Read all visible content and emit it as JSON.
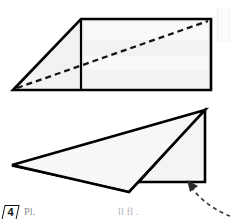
{
  "figure": {
    "step_number": "4",
    "caption_partial": "Pl.",
    "caption_partial_2": "ll  fl .",
    "background_color": "#ffffff",
    "paper_fill": "#f2f2f2",
    "paper_fill_light": "#fafafa",
    "outline_color": "#000000",
    "shadow_color": "#000000",
    "fold_line_color": "#1a1a1a",
    "arrow_color": "#3a3a3a"
  },
  "top_shape": {
    "name": "unfolded-trapezoid-with-diagonal-crease",
    "outline_points": "13,90 81,19 211,19 211,90",
    "fill": "#f2f2f2",
    "stroke_width": "2.6",
    "vertical_fold_line": {
      "x1": 81,
      "y1": 19,
      "x2": 81,
      "y2": 90
    },
    "diagonal_crease": {
      "x1": 17,
      "y1": 88,
      "x2": 208,
      "y2": 21,
      "style": "dashed"
    },
    "crease_dash_pattern": "6 4"
  },
  "bottom_shape": {
    "name": "folded-paper-with-black-wedge",
    "left_flap_points": "12,165 205,110 128,191",
    "right_panel_points": "205,110 205,182 125,182",
    "black_wedge_points": "205,110 122,182 138,182",
    "apex": {
      "x": 205,
      "y": 110
    },
    "left_tip": {
      "x": 12,
      "y": 165
    },
    "bottom_right": {
      "x": 205,
      "y": 182
    },
    "fill": "#f4f4f4",
    "stroke_width": "2.6"
  },
  "motion_arrow": {
    "name": "curved-fold-arrow",
    "path": "M 228,214 C 216,210 200,200 191,187",
    "style": "dashed",
    "dash_pattern": "4 3.5",
    "head_points": "188,182 198,186 191,191",
    "direction": "up-left"
  }
}
